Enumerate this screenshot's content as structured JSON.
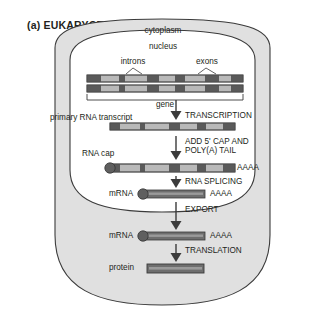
{
  "figure": {
    "panel_label": "(a) EUKARYOTES",
    "compartments": {
      "cytoplasm": "cytoplasm",
      "nucleus": "nucleus"
    },
    "annotations": {
      "introns": "introns",
      "exons": "exons",
      "gene": "gene",
      "primary_transcript": "primary RNA transcript",
      "rna_cap": "RNA cap",
      "mrna_nuclear": "mRNA",
      "mrna_cytoplasmic": "mRNA",
      "protein": "protein",
      "polya_tail_nuclear": "AAAA",
      "polya_tail_capped": "AAAA",
      "polya_tail_cytoplasmic": "AAAA"
    },
    "steps": [
      {
        "id": "transcription",
        "label": "TRANSCRIPTION"
      },
      {
        "id": "capping",
        "label_line1": "ADD 5' CAP AND",
        "label_line2": "POLY(A) TAIL"
      },
      {
        "id": "splicing",
        "label": "RNA SPLICING"
      },
      {
        "id": "export",
        "label": "EXPORT"
      },
      {
        "id": "translation",
        "label": "TRANSLATION"
      }
    ],
    "colors": {
      "cytoplasm_fill": "#e0e0e0",
      "nucleus_fill": "#ffffff",
      "outline": "#3b3b3b",
      "exon_dark": "#5a5a5a",
      "intron_light": "#b9b9b9",
      "bar_dark": "#6e6e6e",
      "bar_highlight": "#9a9a9a",
      "text": "#231f20"
    },
    "dna": {
      "strand_count": 2,
      "segments": [
        {
          "type": "exon",
          "x": 0,
          "w": 14
        },
        {
          "type": "intron",
          "x": 14,
          "w": 18
        },
        {
          "type": "exon",
          "x": 32,
          "w": 6
        },
        {
          "type": "intron",
          "x": 38,
          "w": 22
        },
        {
          "type": "exon",
          "x": 60,
          "w": 12
        },
        {
          "type": "intron",
          "x": 72,
          "w": 16
        },
        {
          "type": "exon",
          "x": 88,
          "w": 10
        },
        {
          "type": "intron",
          "x": 98,
          "w": 20
        },
        {
          "type": "exon",
          "x": 118,
          "w": 14
        },
        {
          "type": "intron",
          "x": 132,
          "w": 12
        },
        {
          "type": "exon",
          "x": 144,
          "w": 12
        }
      ]
    },
    "transcript": {
      "segments": [
        {
          "type": "exon",
          "x": 0,
          "w": 10
        },
        {
          "type": "intron",
          "x": 10,
          "w": 20
        },
        {
          "type": "exon",
          "x": 30,
          "w": 5
        },
        {
          "type": "intron",
          "x": 35,
          "w": 24
        },
        {
          "type": "exon",
          "x": 59,
          "w": 11
        },
        {
          "type": "intron",
          "x": 70,
          "w": 17
        },
        {
          "type": "exon",
          "x": 87,
          "w": 9
        },
        {
          "type": "intron",
          "x": 96,
          "w": 17
        },
        {
          "type": "exon",
          "x": 113,
          "w": 12
        }
      ]
    }
  }
}
